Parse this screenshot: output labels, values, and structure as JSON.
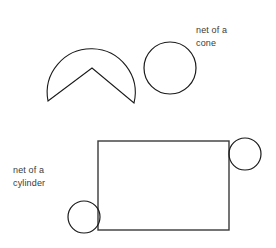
{
  "figure": {
    "background_color": "#ffffff",
    "stroke_color": "#1a1a1a",
    "text_color": "#3b3b3b",
    "width": 276,
    "height": 248
  },
  "cone_net": {
    "label": "net of a\ncone",
    "label_line_1": "net of a",
    "label_line_2": "cone",
    "sector": {
      "center_x": 91,
      "center_y": 57,
      "radius": 44,
      "apex_x": 92,
      "apex_y": 68,
      "arc_start_x": 48,
      "arc_start_y": 101,
      "arc_end_x": 134,
      "arc_end_y": 103,
      "path": "M 48 101 A 44 44 0 1 1 134 103 L 92 68 Z"
    },
    "base_circle": {
      "center_x": 170,
      "center_y": 68,
      "radius": 26
    }
  },
  "cylinder_net": {
    "label": "net of a\ncylinder",
    "label_line_1": "net of a",
    "label_line_2": "cylinder",
    "rectangle": {
      "x": 98,
      "y": 141,
      "width": 131,
      "height": 89
    },
    "top_circle": {
      "center_x": 245,
      "center_y": 154,
      "radius": 16
    },
    "bottom_circle": {
      "center_x": 84,
      "center_y": 217,
      "radius": 16
    }
  }
}
